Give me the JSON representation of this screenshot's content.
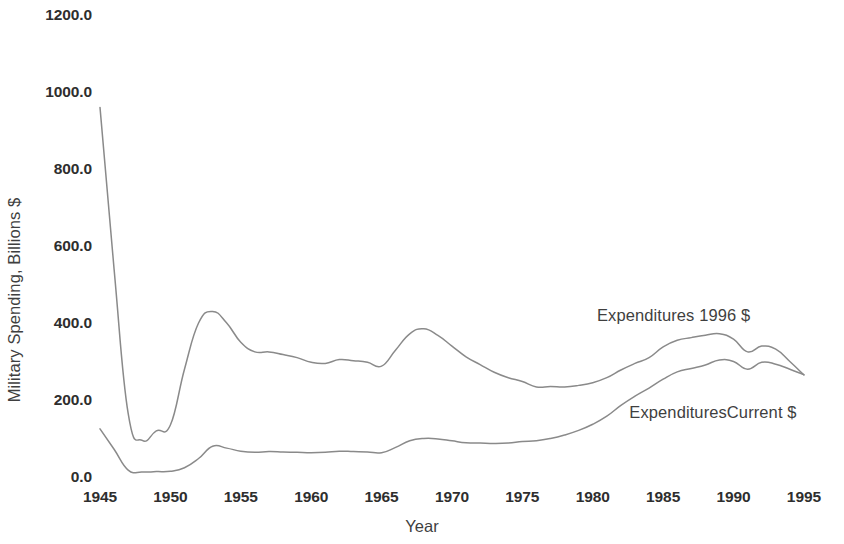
{
  "chart_data": {
    "type": "line",
    "title": "",
    "xlabel": "Year",
    "ylabel": "Military Spending, Billions $",
    "xlim": [
      1945,
      1996
    ],
    "ylim": [
      0,
      1200
    ],
    "grid": false,
    "legend_position": "inline-annotation",
    "y_ticks": [
      "0.0",
      "200.0",
      "400.0",
      "600.0",
      "800.0",
      "1000.0",
      "1200.0"
    ],
    "y_tick_values": [
      0,
      200,
      400,
      600,
      800,
      1000,
      1200
    ],
    "x_ticks": [
      "1945",
      "1950",
      "1955",
      "1960",
      "1965",
      "1970",
      "1975",
      "1980",
      "1985",
      "1990",
      "1995"
    ],
    "x_tick_values": [
      1945,
      1950,
      1955,
      1960,
      1965,
      1970,
      1975,
      1980,
      1985,
      1990,
      1995
    ],
    "x": [
      1945,
      1946,
      1947,
      1948,
      1949,
      1950,
      1951,
      1952,
      1953,
      1954,
      1955,
      1956,
      1957,
      1958,
      1959,
      1960,
      1961,
      1962,
      1963,
      1964,
      1965,
      1966,
      1967,
      1968,
      1969,
      1970,
      1971,
      1972,
      1973,
      1974,
      1975,
      1976,
      1977,
      1978,
      1979,
      1980,
      1981,
      1982,
      1983,
      1984,
      1985,
      1986,
      1987,
      1988,
      1989,
      1990,
      1991,
      1992,
      1993,
      1994,
      1995
    ],
    "series": [
      {
        "name": "Expenditures 1996 $",
        "color": "#8a8a8a",
        "values": [
          960,
          540,
          165,
          95,
          120,
          135,
          280,
          400,
          430,
          400,
          350,
          325,
          325,
          318,
          310,
          298,
          295,
          305,
          302,
          298,
          288,
          330,
          372,
          385,
          368,
          340,
          312,
          292,
          272,
          258,
          248,
          234,
          235,
          234,
          238,
          245,
          258,
          278,
          295,
          310,
          338,
          355,
          362,
          368,
          372,
          358,
          325,
          340,
          332,
          300,
          265
        ]
      },
      {
        "name": "ExpendituresCurrent $",
        "color": "#8a8a8a",
        "values": [
          125,
          72,
          18,
          13,
          14,
          15,
          24,
          48,
          80,
          75,
          67,
          64,
          66,
          65,
          64,
          63,
          64,
          67,
          66,
          65,
          63,
          77,
          94,
          100,
          99,
          94,
          89,
          88,
          87,
          88,
          92,
          94,
          100,
          109,
          121,
          137,
          158,
          186,
          210,
          231,
          254,
          273,
          282,
          291,
          304,
          300,
          280,
          298,
          293,
          280,
          266
        ]
      }
    ],
    "annotations": [
      {
        "text": "Expenditures 1996 $",
        "series": "Expenditures 1996 $"
      },
      {
        "text": "ExpendituresCurrent $",
        "series": "ExpendituresCurrent $"
      }
    ]
  }
}
